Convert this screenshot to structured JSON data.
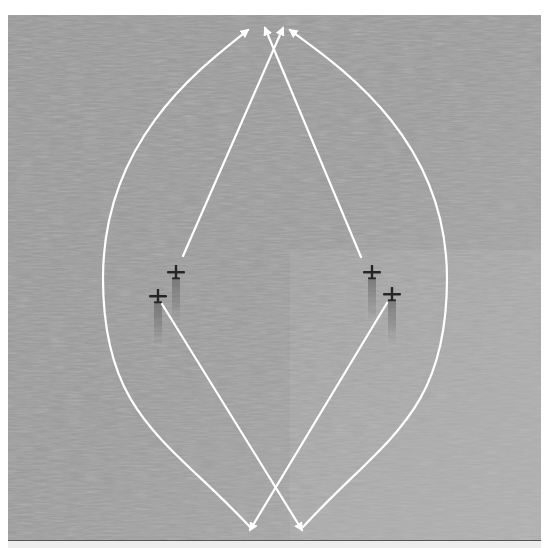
{
  "scene": {
    "type": "aerial-photo-diagram",
    "description": "Grayscale aerial view of ocean with two pairs of aircraft and white maneuver arrows (weave pattern)",
    "colors": {
      "water_base": "#9a9a9a",
      "water_highlight": "#c8c8c8",
      "water_shadow": "#8a8a8a",
      "arrow": "#ffffff",
      "aircraft": "#2a2a2a",
      "page_background": "#ffffff",
      "bottom_strip": "#ededed"
    },
    "aircraft": [
      {
        "id": "left-lead",
        "x": 176,
        "y": 273
      },
      {
        "id": "left-wing",
        "x": 158,
        "y": 297
      },
      {
        "id": "right-lead",
        "x": 372,
        "y": 273
      },
      {
        "id": "right-wing",
        "x": 392,
        "y": 295
      }
    ],
    "arrows": [
      {
        "id": "left-arc",
        "kind": "curve",
        "from": [
          250,
          527
        ],
        "to": [
          248,
          30
        ],
        "via_x": 103
      },
      {
        "id": "right-arc",
        "kind": "curve",
        "from": [
          303,
          527
        ],
        "to": [
          290,
          30
        ],
        "via_x": 447
      },
      {
        "id": "left-up",
        "kind": "straight",
        "from": [
          183,
          256
        ],
        "to": [
          283,
          28
        ]
      },
      {
        "id": "right-up",
        "kind": "straight",
        "from": [
          361,
          257
        ],
        "to": [
          265,
          28
        ]
      },
      {
        "id": "left-down",
        "kind": "straight",
        "from": [
          162,
          304
        ],
        "to": [
          302,
          530
        ]
      },
      {
        "id": "right-down",
        "kind": "straight",
        "from": [
          387,
          303
        ],
        "to": [
          250,
          530
        ]
      }
    ]
  }
}
